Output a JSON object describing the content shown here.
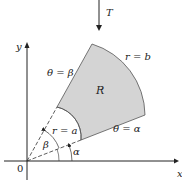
{
  "transform_label": "T",
  "axes": {
    "x_label": "x",
    "y_label": "y",
    "origin_label": "0"
  },
  "region": {
    "label": "R",
    "fill": "#d4d4d4"
  },
  "boundaries": {
    "outer_arc": "r = b",
    "inner_arc": "r = a",
    "upper_ray": "θ = β",
    "lower_ray": "θ = α"
  },
  "angles": {
    "alpha": "α",
    "beta": "β"
  }
}
